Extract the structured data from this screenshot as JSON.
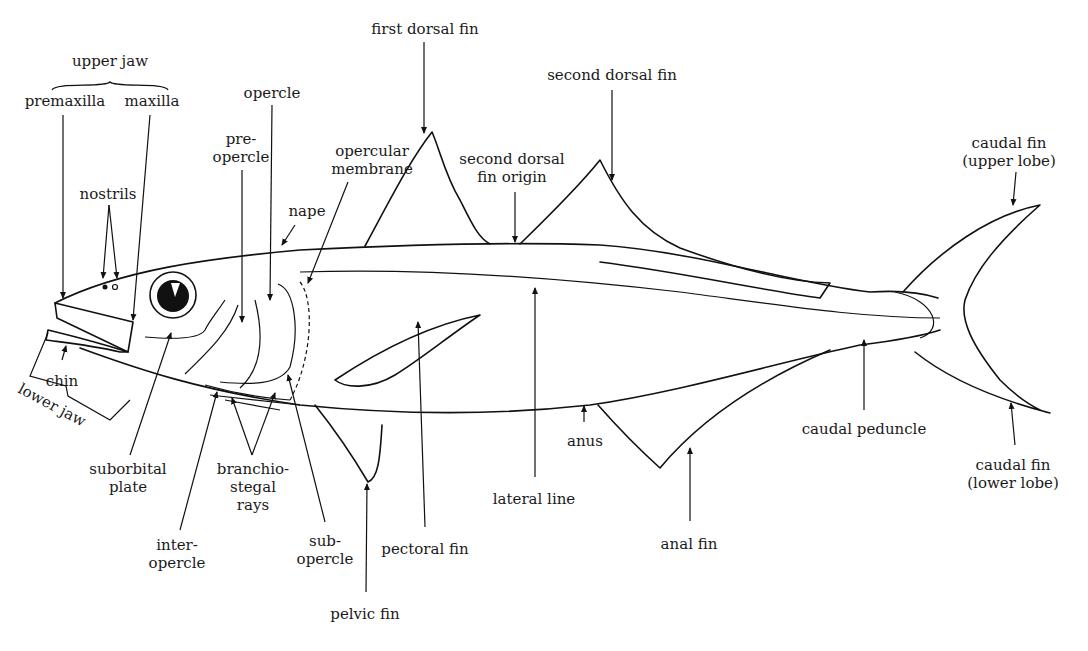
{
  "diagram": {
    "ink_color": "#111111",
    "background_color": "#ffffff",
    "labels": [
      {
        "id": "upper-jaw",
        "text": "upper jaw",
        "x": 110,
        "y": 60
      },
      {
        "id": "premaxilla",
        "text": "premaxilla",
        "x": 65,
        "y": 100
      },
      {
        "id": "maxilla",
        "text": "maxilla",
        "x": 152,
        "y": 100
      },
      {
        "id": "nostrils",
        "text": "nostrils",
        "x": 108,
        "y": 188
      },
      {
        "id": "opercle",
        "text": "opercle",
        "x": 272,
        "y": 88
      },
      {
        "id": "preopercle",
        "text": "pre-\nopercle",
        "x": 241,
        "y": 132
      },
      {
        "id": "opercular-membrane",
        "text": "opercular\nmembrane",
        "x": 372,
        "y": 142
      },
      {
        "id": "nape",
        "text": "nape",
        "x": 307,
        "y": 205
      },
      {
        "id": "first-dorsal-fin",
        "text": "first dorsal fin",
        "x": 425,
        "y": 22
      },
      {
        "id": "second-dorsal-fin-origin",
        "text": "second dorsal\nfin origin",
        "x": 512,
        "y": 150
      },
      {
        "id": "second-dorsal-fin",
        "text": "second dorsal fin",
        "x": 612,
        "y": 70
      },
      {
        "id": "caudal-fin-upper",
        "text": "caudal fin\n(upper lobe)",
        "x": 1009,
        "y": 132
      },
      {
        "id": "chin",
        "text": "chin",
        "x": 62,
        "y": 372
      },
      {
        "id": "lower-jaw",
        "text": "lower jaw",
        "x": 42,
        "y": 400
      },
      {
        "id": "suborbital-plate",
        "text": "suborbital\nplate",
        "x": 128,
        "y": 463
      },
      {
        "id": "inter-opercle",
        "text": "inter-\nopercle",
        "x": 177,
        "y": 544
      },
      {
        "id": "branchiostegal-rays",
        "text": "branchio-\nstegal\nrays",
        "x": 253,
        "y": 463
      },
      {
        "id": "sub-opercle",
        "text": "sub-\nopercle",
        "x": 325,
        "y": 533
      },
      {
        "id": "pelvic-fin",
        "text": "pelvic fin",
        "x": 365,
        "y": 606
      },
      {
        "id": "pectoral-fin",
        "text": "pectoral fin",
        "x": 425,
        "y": 541
      },
      {
        "id": "lateral-line",
        "text": "lateral line",
        "x": 534,
        "y": 491
      },
      {
        "id": "anus",
        "text": "anus",
        "x": 585,
        "y": 436
      },
      {
        "id": "anal-fin",
        "text": "anal fin",
        "x": 689,
        "y": 535
      },
      {
        "id": "caudal-peduncle",
        "text": "caudal peduncle",
        "x": 864,
        "y": 423
      },
      {
        "id": "caudal-fin-lower",
        "text": "caudal fin\n(lower lobe)",
        "x": 1013,
        "y": 458
      }
    ]
  }
}
